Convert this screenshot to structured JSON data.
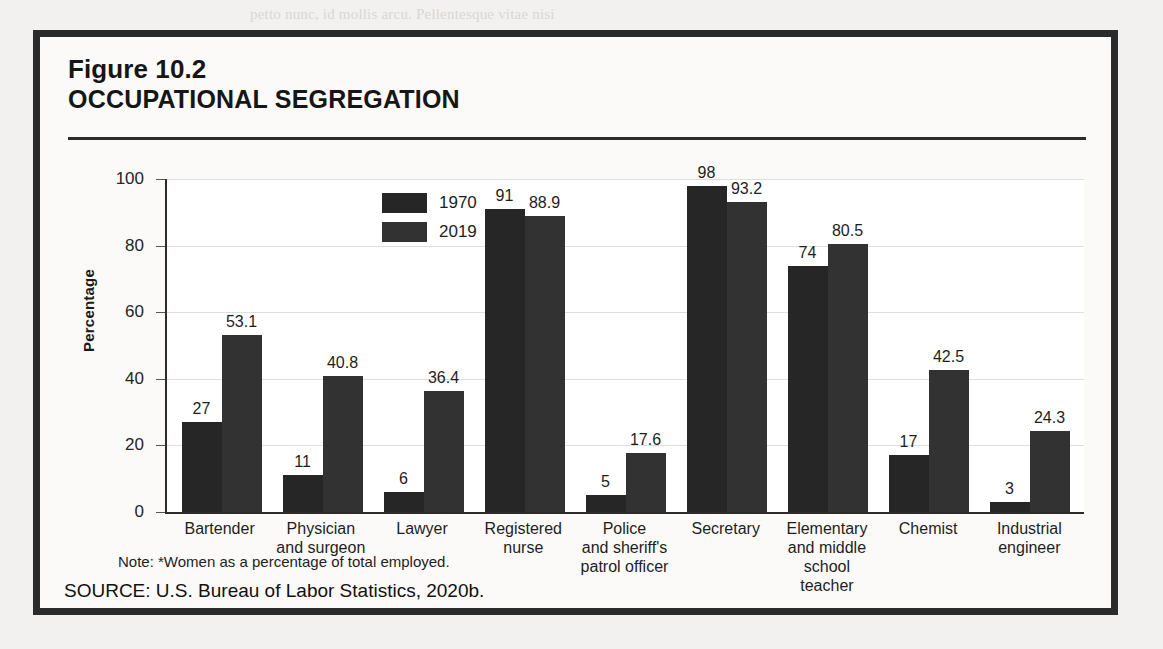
{
  "figure": {
    "number": "Figure 10.2",
    "title": "OCCUPATIONAL SEGREGATION",
    "note": "Note: *Women as a percentage of total employed.",
    "source": "SOURCE: U.S. Bureau of Labor Statistics, 2020b."
  },
  "colors": {
    "series_1970": "#262626",
    "series_2019": "#323232",
    "frame": "#2b2b2b",
    "card_background": "#fbfaf8",
    "page_background": "#f2f1ef",
    "gridline": "#dedede"
  },
  "bleed": {
    "l1": "petto nunc, id mollis arcu. Pellentesque vitae nisi",
    "l2": "nullam vel sapien velit, ut egestas velit. Nunc wu",
    "l3": "aenean tincidunt odio a lacus gravida, ut ultricies",
    "l4": "ccupational Segregation",
    "l5": "nunc, sed rutrum metus. Vivamus in lectus quis",
    "l6": "tincidunt porta, nulla lorem ultrices sapien, eget",
    "l7": "donec quis orci ac leo imperdiet vehicula ultrices",
    "l8": "curabitur et nisl vel augue mattis lacinia vel eget",
    "l9": "nullam eget ligula ac metus vestibulum tincidunt"
  },
  "chart_data": {
    "type": "bar",
    "title": "OCCUPATIONAL SEGREGATION",
    "xlabel": "",
    "ylabel": "Percentage",
    "ylim": [
      0,
      100
    ],
    "yticks": [
      0,
      20,
      40,
      60,
      80,
      100
    ],
    "grid": "horizontal",
    "legend_position": "top-left-inside",
    "categories": [
      "Bartender",
      "Physician\nand surgeon",
      "Lawyer",
      "Registered\nnurse",
      "Police\nand sheriff's\npatrol officer",
      "Secretary",
      "Elementary\nand middle\nschool teacher",
      "Chemist",
      "Industrial\nengineer"
    ],
    "series": [
      {
        "name": "1970",
        "values": [
          27,
          11,
          6,
          91,
          5,
          98,
          74,
          17,
          3
        ],
        "labels": [
          "27",
          "11",
          "6",
          "91",
          "5",
          "98",
          "74",
          "17",
          "3"
        ]
      },
      {
        "name": "2019",
        "values": [
          53.1,
          40.8,
          36.4,
          88.9,
          17.6,
          93.2,
          80.5,
          42.5,
          24.3
        ],
        "labels": [
          "53.1",
          "40.8",
          "36.4",
          "88.9",
          "17.6",
          "93.2",
          "80.5",
          "42.5",
          "24.3"
        ]
      }
    ],
    "annotations": [
      "Note: *Women as a percentage of total employed."
    ]
  }
}
